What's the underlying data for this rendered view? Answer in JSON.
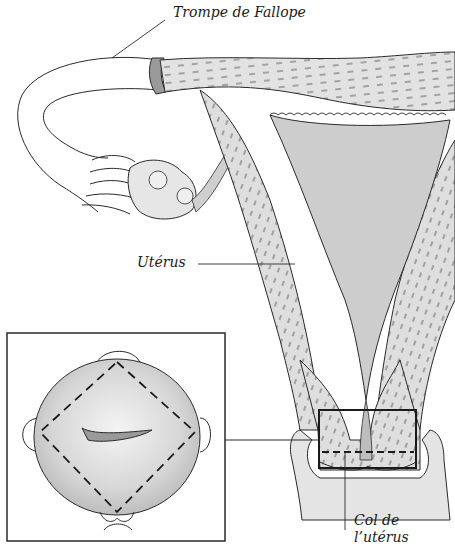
{
  "diagram": {
    "labels": {
      "fallopian_tube": "Trompe de Fallope",
      "uterus": "Utérus",
      "cervix_line1": "Col de",
      "cervix_line2": "l’utérus"
    },
    "colors": {
      "line": "#2a2a2a",
      "tissue_fill": "#d9d9d9",
      "cavity_fill": "#c8c8c8",
      "background": "#ffffff"
    },
    "inset": {
      "description": "Front view of cervix with dashed purse-string suture and knot",
      "box": {
        "x": 7,
        "y": 333,
        "w": 218,
        "h": 208
      }
    },
    "highlight_box": {
      "x": 319,
      "y": 410,
      "w": 97,
      "h": 58
    }
  }
}
